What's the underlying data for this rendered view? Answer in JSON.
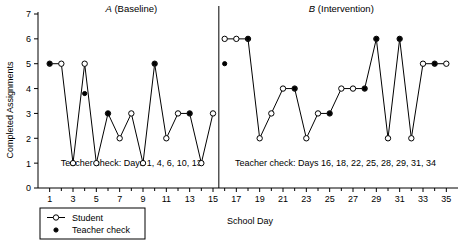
{
  "chart_data": {
    "type": "line",
    "title": "",
    "xlabel": "School Day",
    "ylabel": "Completed Assignments",
    "xlim": [
      0,
      36
    ],
    "ylim": [
      0,
      7
    ],
    "grid": false,
    "legend_position": "bottom-left",
    "y_ticks": [
      0,
      1,
      2,
      3,
      4,
      5,
      6,
      7
    ],
    "x_ticks": [
      1,
      3,
      5,
      7,
      9,
      11,
      13,
      15,
      17,
      19,
      21,
      23,
      25,
      27,
      29,
      31,
      33,
      35
    ],
    "x_minor_ticks": [
      2,
      4,
      6,
      8,
      10,
      12,
      14,
      16,
      18,
      20,
      22,
      24,
      26,
      28,
      30,
      32,
      34
    ],
    "phase_divider_x": 15.5,
    "phases": [
      {
        "label_italic": "A",
        "label_rest": " (Baseline)",
        "annotation": "Teacher check: Days 1, 4, 6, 10, 13",
        "annotation_x": 8,
        "annotation_y": 1.0,
        "title_x": 8
      },
      {
        "label_italic": "B",
        "label_rest": " (Intervention)",
        "annotation": "Teacher check: Days 16, 18, 22, 25, 28, 29, 31, 34",
        "annotation_x": 25.5,
        "annotation_y": 1.0,
        "title_x": 26
      }
    ],
    "series": [
      {
        "name": "Student",
        "marker": "open-circle",
        "x": [
          1,
          2,
          3,
          4,
          5,
          6,
          7,
          8,
          9,
          10,
          11,
          12,
          13,
          14,
          15,
          16,
          17,
          18,
          19,
          20,
          21,
          22,
          23,
          24,
          25,
          26,
          27,
          28,
          29,
          30,
          31,
          32,
          33,
          34,
          35
        ],
        "values": [
          5,
          5,
          1,
          5,
          1,
          3,
          2,
          3,
          1,
          5,
          2,
          3,
          3,
          1,
          3,
          6,
          6,
          6,
          2,
          3,
          4,
          4,
          2,
          3,
          3,
          4,
          4,
          4,
          6,
          2,
          6,
          2,
          5,
          5,
          5
        ]
      },
      {
        "name": "Teacher check",
        "marker": "filled-circle",
        "x": [
          1,
          4,
          6,
          10,
          13,
          16,
          18,
          22,
          25,
          28,
          29,
          31,
          34
        ],
        "values": [
          5,
          3.8,
          3,
          5,
          3,
          5,
          6,
          4,
          3,
          4,
          6,
          6,
          5
        ]
      }
    ],
    "legend": [
      {
        "label": "Student",
        "marker": "open-circle-line"
      },
      {
        "label": "Teacher check",
        "marker": "filled-circle"
      }
    ]
  }
}
